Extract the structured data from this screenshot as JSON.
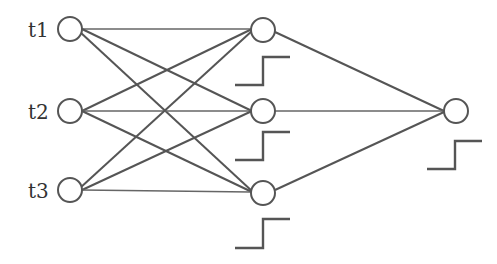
{
  "diagram": {
    "type": "neural-network",
    "colors": {
      "stroke": "#555555",
      "background": "#ffffff",
      "text": "#333333"
    },
    "input_layer": [
      {
        "id": "t1",
        "label": "t1"
      },
      {
        "id": "t2",
        "label": "t2"
      },
      {
        "id": "t3",
        "label": "t3"
      }
    ],
    "hidden_layer": [
      {
        "id": "h1",
        "activation": "step"
      },
      {
        "id": "h2",
        "activation": "step"
      },
      {
        "id": "h3",
        "activation": "step"
      }
    ],
    "output_layer": [
      {
        "id": "o1",
        "activation": "step"
      }
    ],
    "connections": "fully-connected: inputs→hidden, hidden→output",
    "icons": {
      "activation": "step-function-icon"
    }
  }
}
